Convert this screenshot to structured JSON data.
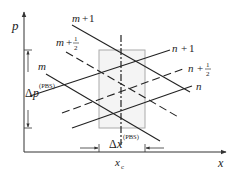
{
  "diagram": {
    "axes": {
      "y_label": "p",
      "x_label": "x"
    },
    "lines": {
      "m_plus_1": {
        "base": "m",
        "op": "+",
        "num": "1"
      },
      "m_plus_half": {
        "base": "m",
        "op": "+",
        "num": "1",
        "den": "2"
      },
      "m": {
        "base": "m"
      },
      "n_plus_1": {
        "base": "n",
        "op": "+",
        "num": "1"
      },
      "n_plus_half": {
        "base": "n",
        "op": "+",
        "num": "1",
        "den": "2"
      },
      "n": {
        "base": "n"
      }
    },
    "delta_p": {
      "symbol": "Δ",
      "var": "p",
      "sup": "(PBS)"
    },
    "delta_x": {
      "symbol": "Δ",
      "var": "x",
      "sup": "(PBS)"
    },
    "center": {
      "var": "x",
      "sub": "c"
    },
    "colors": {
      "line": "#222222",
      "box_stroke": "#aaaaaa",
      "box_fill": "#f4f4f4"
    }
  }
}
